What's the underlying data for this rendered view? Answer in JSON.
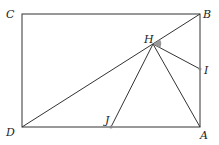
{
  "diagram": {
    "points": {
      "A": {
        "label": "A",
        "x": 200,
        "y": 127
      },
      "B": {
        "label": "B",
        "x": 200,
        "y": 14
      },
      "C": {
        "label": "C",
        "x": 22,
        "y": 14
      },
      "D": {
        "label": "D",
        "x": 22,
        "y": 127
      },
      "H": {
        "label": "H",
        "x": 153,
        "y": 44
      },
      "I": {
        "label": "I",
        "x": 200,
        "y": 69
      },
      "J": {
        "label": "J",
        "x": 111,
        "y": 127
      }
    },
    "segments": [
      "CB",
      "BA",
      "AD",
      "DC",
      "DB",
      "HJ",
      "HA",
      "HI"
    ],
    "angle_mark": {
      "vertex": "H",
      "between": [
        "B",
        "I"
      ],
      "color": "#999999"
    }
  }
}
